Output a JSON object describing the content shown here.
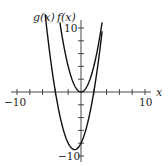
{
  "chart_data": {
    "type": "line",
    "title": "",
    "xlabel": "x",
    "ylabel": "",
    "xlim": [
      -10,
      10
    ],
    "ylim": [
      -10,
      10
    ],
    "grid": false,
    "x_ticks": [
      -10,
      -8,
      -6,
      -4,
      -2,
      0,
      2,
      4,
      6,
      8,
      10
    ],
    "y_ticks": [
      -10,
      -8,
      -6,
      -4,
      -2,
      0,
      2,
      4,
      6,
      8,
      10
    ],
    "x_tick_labels": {
      "-10": "−10",
      "10": "10"
    },
    "y_tick_labels": {
      "-10": "−10",
      "10": "10"
    },
    "series": [
      {
        "name": "g(x)",
        "expression": "(x+1)^2 - 9",
        "x": [
          -5.6,
          -5,
          -4,
          -3,
          -2,
          -1,
          0,
          1,
          2,
          3,
          3.3
        ],
        "values": [
          12.2,
          7,
          0,
          -5,
          -8,
          -9,
          -8,
          -5,
          0,
          7,
          9.5
        ]
      },
      {
        "name": "f(x)",
        "expression": "x^2",
        "x": [
          -3.3,
          -3,
          -2,
          -1,
          0,
          1,
          2,
          3,
          3.3
        ],
        "values": [
          10.9,
          9,
          4,
          1,
          0,
          1,
          4,
          9,
          10.9
        ]
      }
    ],
    "legend": [
      "g(x)",
      "f(x)"
    ],
    "annotations": [
      {
        "text": "g(x)",
        "position": "top-left near curve start"
      },
      {
        "text": "f(x)",
        "position": "top near curve start"
      }
    ]
  },
  "labels": {
    "g": "g(x)",
    "f": "f(x)",
    "x_axis": "x",
    "x_min": "−10",
    "x_max": "10",
    "y_max": "10",
    "y_min": "−10"
  }
}
